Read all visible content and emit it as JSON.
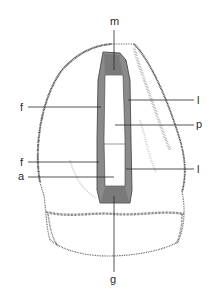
{
  "figure": {
    "type": "dental cavity preparation diagram",
    "colors": {
      "background": "#ffffff",
      "tooth_stipple": "#3a3a3a",
      "preparation_fill": "#8a8a8a",
      "preparation_outline": "#3c3c3c",
      "leader_lines": "#2a2a2a",
      "label_text": "#2a2a2a"
    },
    "labels": [
      {
        "id": "m",
        "text": "m",
        "side": "top"
      },
      {
        "id": "f1",
        "text": "f",
        "side": "left"
      },
      {
        "id": "l1",
        "text": "l",
        "side": "right"
      },
      {
        "id": "p",
        "text": "p",
        "side": "right"
      },
      {
        "id": "f2",
        "text": "f",
        "side": "left"
      },
      {
        "id": "a",
        "text": "a",
        "side": "left"
      },
      {
        "id": "l2",
        "text": "l",
        "side": "right"
      },
      {
        "id": "g",
        "text": "g",
        "side": "bottom"
      }
    ]
  }
}
